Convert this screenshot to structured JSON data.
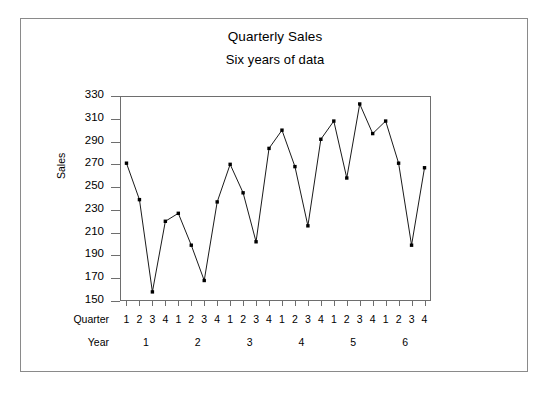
{
  "chart_data": {
    "type": "line",
    "title": "Quarterly Sales",
    "subtitle": "Six years of data",
    "xlabel": "",
    "ylabel": "Sales",
    "ylim": [
      150,
      330
    ],
    "yticks": [
      330,
      310,
      290,
      270,
      250,
      230,
      210,
      190,
      170,
      150
    ],
    "grid": false,
    "legend": null,
    "marker": "filled-square",
    "line_color": "#000000",
    "marker_color": "#000000",
    "x": [
      1,
      2,
      3,
      4,
      5,
      6,
      7,
      8,
      9,
      10,
      11,
      12,
      13,
      14,
      15,
      16,
      17,
      18,
      19,
      20,
      21,
      22,
      23,
      24
    ],
    "values": [
      271,
      239,
      158,
      220,
      227,
      199,
      168,
      237,
      270,
      245,
      202,
      284,
      300,
      268,
      216,
      292,
      308,
      258,
      323,
      297,
      308,
      271,
      199,
      267
    ],
    "quarter_axis_label": "Quarter",
    "quarter_ticks": [
      "1",
      "2",
      "3",
      "4",
      "1",
      "2",
      "3",
      "4",
      "1",
      "2",
      "3",
      "4",
      "1",
      "2",
      "3",
      "4",
      "1",
      "2",
      "3",
      "4",
      "1",
      "2",
      "3",
      "4"
    ],
    "year_axis_label": "Year",
    "year_ticks": [
      "1",
      "2",
      "3",
      "4",
      "5",
      "6"
    ]
  }
}
